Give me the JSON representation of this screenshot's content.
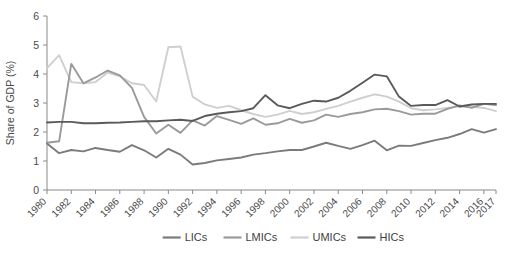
{
  "chart_data": {
    "type": "line",
    "title": "",
    "xlabel": "",
    "ylabel": "Share of GDP (%)",
    "ylim": [
      0,
      6
    ],
    "yticks": [
      0,
      1,
      2,
      3,
      4,
      5,
      6
    ],
    "xlim": [
      1980,
      2017
    ],
    "xticks": [
      1980,
      1982,
      1984,
      1986,
      1988,
      1990,
      1992,
      1994,
      1996,
      1998,
      2000,
      2002,
      2004,
      2006,
      2008,
      2010,
      2012,
      2014,
      2016,
      2017
    ],
    "xtick_labels": [
      "1980",
      "1982",
      "1984",
      "1986",
      "1988",
      "1990",
      "1992",
      "1994",
      "1996",
      "1998",
      "2000",
      "2002",
      "2004",
      "2006",
      "2008",
      "2010",
      "2012",
      "2014",
      "2016",
      "2017"
    ],
    "grid": false,
    "legend_position": "bottom",
    "x": [
      1980,
      1981,
      1982,
      1983,
      1984,
      1985,
      1986,
      1987,
      1988,
      1989,
      1990,
      1991,
      1992,
      1993,
      1994,
      1995,
      1996,
      1997,
      1998,
      1999,
      2000,
      2001,
      2002,
      2003,
      2004,
      2005,
      2006,
      2007,
      2008,
      2009,
      2010,
      2011,
      2012,
      2013,
      2014,
      2015,
      2016,
      2017
    ],
    "series": [
      {
        "name": "LICs",
        "color": "#7b7b7b",
        "values": [
          1.6,
          1.27,
          1.38,
          1.33,
          1.45,
          1.38,
          1.32,
          1.55,
          1.37,
          1.12,
          1.42,
          1.22,
          0.88,
          0.93,
          1.02,
          1.07,
          1.12,
          1.22,
          1.27,
          1.33,
          1.38,
          1.38,
          1.5,
          1.63,
          1.52,
          1.42,
          1.55,
          1.7,
          1.37,
          1.53,
          1.52,
          1.62,
          1.72,
          1.8,
          1.93,
          2.1,
          1.98,
          2.1
        ]
      },
      {
        "name": "LMICs",
        "color": "#9a9a9a",
        "values": [
          1.63,
          1.68,
          4.35,
          3.68,
          3.88,
          4.12,
          3.95,
          3.52,
          2.52,
          1.95,
          2.25,
          1.97,
          2.4,
          2.22,
          2.55,
          2.42,
          2.28,
          2.47,
          2.25,
          2.3,
          2.45,
          2.32,
          2.4,
          2.6,
          2.52,
          2.62,
          2.68,
          2.78,
          2.8,
          2.72,
          2.6,
          2.63,
          2.63,
          2.8,
          2.92,
          2.83,
          2.97,
          2.93
        ]
      },
      {
        "name": "UMICs",
        "color": "#cfcfcf",
        "values": [
          4.2,
          4.65,
          3.72,
          3.68,
          3.72,
          4.05,
          3.92,
          3.68,
          3.62,
          3.05,
          4.92,
          4.95,
          3.22,
          2.95,
          2.83,
          2.9,
          2.75,
          2.62,
          2.52,
          2.6,
          2.73,
          2.62,
          2.68,
          2.8,
          2.9,
          3.05,
          3.18,
          3.3,
          3.22,
          3.05,
          2.82,
          2.75,
          2.78,
          2.83,
          2.88,
          2.87,
          2.83,
          2.72
        ]
      },
      {
        "name": "HICs",
        "color": "#5a5a5a",
        "values": [
          2.33,
          2.35,
          2.35,
          2.3,
          2.3,
          2.32,
          2.33,
          2.35,
          2.37,
          2.37,
          2.4,
          2.42,
          2.38,
          2.55,
          2.63,
          2.68,
          2.72,
          2.82,
          3.27,
          2.92,
          2.82,
          2.97,
          3.08,
          3.05,
          3.18,
          3.42,
          3.7,
          3.98,
          3.92,
          3.22,
          2.9,
          2.93,
          2.93,
          3.1,
          2.88,
          2.95,
          2.97,
          2.97
        ]
      }
    ]
  },
  "legend": {
    "items": [
      {
        "label": "LICs"
      },
      {
        "label": "LMICs"
      },
      {
        "label": "UMICs"
      },
      {
        "label": "HICs"
      }
    ]
  }
}
